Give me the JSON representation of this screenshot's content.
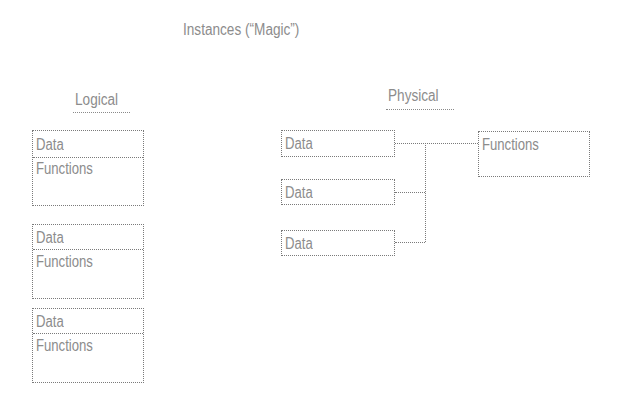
{
  "title": "Instances (“Magic”)",
  "logical": {
    "heading": "Logical",
    "objects": [
      {
        "data_label": "Data",
        "functions_label": "Functions"
      },
      {
        "data_label": "Data",
        "functions_label": "Functions"
      },
      {
        "data_label": "Data",
        "functions_label": "Functions"
      }
    ]
  },
  "physical": {
    "heading": "Physical",
    "data_boxes": [
      {
        "label": "Data"
      },
      {
        "label": "Data"
      },
      {
        "label": "Data"
      }
    ],
    "functions_box": {
      "label": "Functions"
    }
  },
  "colors": {
    "text": "#8c8c8c",
    "border": "#7a7a7a",
    "background": "#ffffff"
  }
}
